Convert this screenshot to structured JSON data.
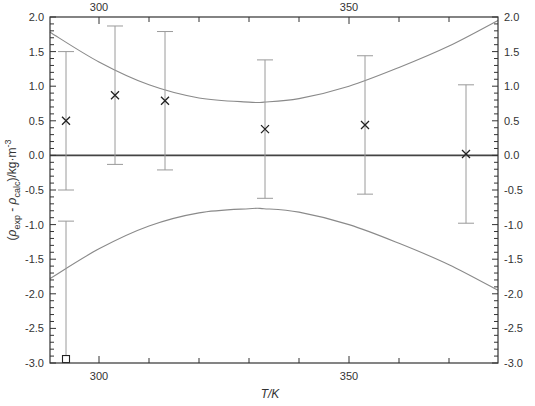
{
  "chart_data": {
    "type": "scatter",
    "title": "",
    "xlabel": "T/K",
    "ylabel": "(ρ_exp - ρ_calc)/kg·m⁻³",
    "xlim": [
      290.2,
      379.8
    ],
    "ylim": [
      -3.0,
      2.0
    ],
    "x_ticks": [
      300,
      350
    ],
    "x_tick_labels": [
      "300",
      "350"
    ],
    "y_ticks": [
      2.0,
      1.5,
      1.0,
      0.5,
      0.0,
      -0.5,
      -1.0,
      -1.5,
      -2.0,
      -2.5,
      -3.0
    ],
    "y_tick_labels": [
      "2.0",
      "1.5",
      "1.0",
      "0.5",
      "0.0",
      "-0.5",
      "-1.0",
      "-1.5",
      "-2.0",
      "-2.5",
      "-3.0"
    ],
    "grid": false,
    "legend": null,
    "series": [
      {
        "name": "deviations (x)",
        "marker": "x",
        "x": [
          293.4,
          303.2,
          313.2,
          333.2,
          353.2,
          373.4
        ],
        "y": [
          0.5,
          0.87,
          0.79,
          0.38,
          0.44,
          0.02
        ],
        "err_low": [
          -0.5,
          -0.13,
          -0.21,
          -0.62,
          -0.56,
          -0.98
        ],
        "err_high": [
          1.5,
          1.87,
          1.79,
          1.38,
          1.44,
          1.02
        ]
      },
      {
        "name": "deviation (square)",
        "marker": "square",
        "x": [
          293.4
        ],
        "y": [
          -2.95
        ],
        "err_low": [
          -2.95
        ],
        "err_high": [
          -0.95
        ]
      },
      {
        "name": "upper uncertainty band",
        "type": "line",
        "x": [
          290.2,
          300,
          310,
          320,
          330,
          333,
          340,
          350,
          360,
          370,
          379.8
        ],
        "y": [
          1.78,
          1.35,
          1.02,
          0.83,
          0.77,
          0.77,
          0.82,
          1.0,
          1.27,
          1.58,
          1.95
        ]
      },
      {
        "name": "lower uncertainty band",
        "type": "line",
        "x": [
          290.2,
          300,
          310,
          320,
          330,
          333,
          340,
          350,
          360,
          370,
          379.8
        ],
        "y": [
          -1.78,
          -1.35,
          -1.02,
          -0.83,
          -0.77,
          -0.77,
          -0.82,
          -1.0,
          -1.27,
          -1.58,
          -1.95
        ]
      },
      {
        "name": "zero line",
        "type": "line",
        "x": [
          290.2,
          379.8
        ],
        "y": [
          0.0,
          0.0
        ]
      }
    ]
  },
  "labels": {
    "top_ticks": [
      "300",
      "350"
    ],
    "bottom_ticks": [
      "300",
      "350"
    ],
    "xlabel": "T/K",
    "ylabel_parts": {
      "open": "(",
      "rho1": "ρ",
      "sub1": "exp",
      "minus": " - ",
      "rho2": "ρ",
      "sub2": "calc",
      "unit": ")/kg·m",
      "sup": "-3"
    }
  }
}
